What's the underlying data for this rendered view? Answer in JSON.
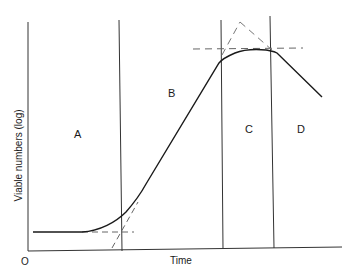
{
  "diagram": {
    "axes": {
      "xlabel": "Time",
      "ylabel": "Viable numbers  (log)",
      "origin": "O"
    },
    "phases": [
      {
        "id": "A",
        "label": "A",
        "meaning": "lag phase"
      },
      {
        "id": "B",
        "label": "B",
        "meaning": "exponential (log) phase"
      },
      {
        "id": "C",
        "label": "C",
        "meaning": "stationary phase"
      },
      {
        "id": "D",
        "label": "D",
        "meaning": "death / decline phase"
      }
    ],
    "colors": {
      "line": "#1a1a1a",
      "dashed": "#777777",
      "background": "#ffffff"
    }
  }
}
